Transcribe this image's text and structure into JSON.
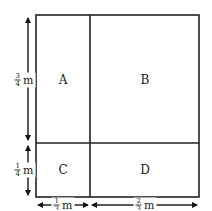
{
  "diagram": {
    "type": "area-model",
    "regions": [
      {
        "id": "A",
        "label": "A"
      },
      {
        "id": "B",
        "label": "B"
      },
      {
        "id": "C",
        "label": "C"
      },
      {
        "id": "D",
        "label": "D"
      }
    ],
    "dimensions": {
      "left_top": {
        "num": "3",
        "den": "4",
        "unit": "m"
      },
      "left_bottom": {
        "num": "1",
        "den": "4",
        "unit": "m"
      },
      "bottom_left": {
        "num": "1",
        "den": "3",
        "unit": "m"
      },
      "bottom_right": {
        "num": "2",
        "den": "3",
        "unit": "m"
      }
    }
  }
}
